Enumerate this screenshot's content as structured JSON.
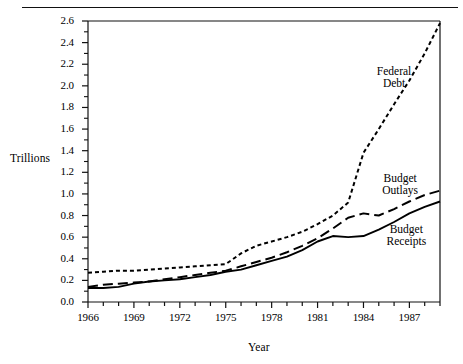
{
  "figure": {
    "name": "federal-budget-chart",
    "axis_title_y": "Trillions",
    "axis_title_x": "Year"
  },
  "chart_data": {
    "type": "line",
    "title": "",
    "subtitle": "",
    "xlabel": "Year",
    "ylabel": "Trillions",
    "xlim": [
      1966,
      1989
    ],
    "ylim": [
      0.0,
      2.6
    ],
    "grid": false,
    "legend_position": "inline-annotations",
    "x_tick_labels": [
      "1966",
      "1969",
      "1972",
      "1975",
      "1978",
      "1981",
      "1984",
      "1987"
    ],
    "x_tick_values": [
      1966,
      1969,
      1972,
      1975,
      1978,
      1981,
      1984,
      1987
    ],
    "x_minor_tick_step": 1,
    "y_tick_labels": [
      "0.0",
      "0.2",
      "0.4",
      "0.6",
      "0.8",
      "1.0",
      "1.2",
      "1.4",
      "1.6",
      "1.8",
      "2.0",
      "2.2",
      "2.4",
      "2.6"
    ],
    "y_tick_values": [
      0.0,
      0.2,
      0.4,
      0.6,
      0.8,
      1.0,
      1.2,
      1.4,
      1.6,
      1.8,
      2.0,
      2.2,
      2.4,
      2.6
    ],
    "y_minor_tick_step": 0.1,
    "x": [
      1966,
      1967,
      1968,
      1969,
      1970,
      1971,
      1972,
      1973,
      1974,
      1975,
      1976,
      1977,
      1978,
      1979,
      1980,
      1981,
      1982,
      1983,
      1984,
      1985,
      1986,
      1987,
      1988,
      1989
    ],
    "series": [
      {
        "name": "Federal Debt",
        "label": "Federal\nDebt",
        "style": "dotted",
        "color": "#000000",
        "values": [
          0.27,
          0.28,
          0.29,
          0.29,
          0.3,
          0.31,
          0.32,
          0.33,
          0.34,
          0.35,
          0.45,
          0.52,
          0.56,
          0.6,
          0.65,
          0.72,
          0.8,
          0.92,
          1.38,
          1.6,
          1.83,
          2.05,
          2.3,
          2.58
        ]
      },
      {
        "name": "Budget Outlays",
        "label": "Budget\nOutlays",
        "style": "dashed",
        "color": "#000000",
        "values": [
          0.14,
          0.16,
          0.17,
          0.18,
          0.19,
          0.21,
          0.23,
          0.25,
          0.27,
          0.29,
          0.33,
          0.37,
          0.41,
          0.46,
          0.52,
          0.59,
          0.68,
          0.78,
          0.82,
          0.8,
          0.86,
          0.93,
          0.99,
          1.03
        ]
      },
      {
        "name": "Budget Receipts",
        "label": "Budget\nReceipts",
        "style": "solid",
        "color": "#000000",
        "values": [
          0.13,
          0.13,
          0.14,
          0.17,
          0.19,
          0.2,
          0.21,
          0.23,
          0.25,
          0.28,
          0.3,
          0.34,
          0.38,
          0.42,
          0.48,
          0.56,
          0.61,
          0.6,
          0.61,
          0.67,
          0.74,
          0.82,
          0.88,
          0.93
        ]
      }
    ],
    "annotations": [
      {
        "text": "Federal Debt",
        "x": 1986.0,
        "y": 2.12
      },
      {
        "text": "Budget Outlays",
        "x": 1986.4,
        "y": 1.13
      },
      {
        "text": "Budget Receipts",
        "x": 1986.8,
        "y": 0.66
      }
    ]
  },
  "labels": {
    "federal_debt_line1": "Federal",
    "federal_debt_line2": "Debt",
    "budget_outlays_line1": "Budget",
    "budget_outlays_line2": "Outlays",
    "budget_receipts_line1": "Budget",
    "budget_receipts_line2": "Receipts"
  }
}
